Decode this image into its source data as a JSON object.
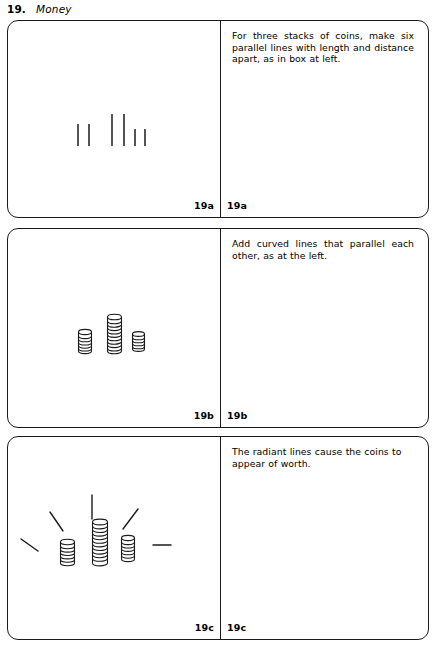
{
  "header": {
    "number": "19.",
    "title": "Money"
  },
  "panels": [
    {
      "id": "19a",
      "label_left": "19a",
      "label_right": "19a",
      "caption": "For three stacks of coins, make six parallel lines with length and distance apart, as in box at left.",
      "art": "six-parallel-lines"
    },
    {
      "id": "19b",
      "label_left": "19b",
      "label_right": "19b",
      "caption": "Add curved lines that parallel each other, as at the left.",
      "art": "three-coin-stacks"
    },
    {
      "id": "19c",
      "label_left": "19c",
      "label_right": "19c",
      "caption": "The radiant lines cause the coins to appear of worth.",
      "art": "coin-stacks-with-radiant-lines"
    }
  ],
  "colors": {
    "ink": "#1b1b1b",
    "paper": "#ffffff"
  }
}
